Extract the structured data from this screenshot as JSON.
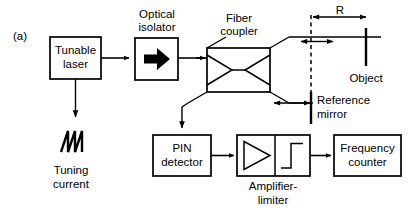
{
  "figure": {
    "panel_label": "(a)",
    "type": "block-diagram"
  },
  "blocks": {
    "tunable_laser": {
      "line1": "Tunable",
      "line2": "laser"
    },
    "optical_isolator": {
      "caption_line1": "Optical",
      "caption_line2": "isolator",
      "symbol": "right-arrow-solid"
    },
    "fiber_coupler": {
      "caption_line1": "Fiber",
      "caption_line2": "coupler",
      "symbol": "bowtie"
    },
    "pin_detector": {
      "line1": "PIN",
      "line2": "detector"
    },
    "amplifier_limiter": {
      "caption_line1": "Amplifier-",
      "caption_line2": "limiter",
      "symbol_left": "triangle-amplifier",
      "symbol_right": "step-limiter"
    },
    "frequency_counter": {
      "line1": "Frequency",
      "line2": "counter"
    }
  },
  "annotations": {
    "tuning_current": {
      "line1": "Tuning",
      "line2": "current",
      "symbol": "sawtooth-waveform"
    },
    "object": {
      "label": "Object"
    },
    "reference_mirror": {
      "line1": "Reference",
      "line2": "mirror"
    },
    "range": {
      "label": "R"
    }
  },
  "colors": {
    "ink": "#000000",
    "paper": "#ffffff"
  }
}
